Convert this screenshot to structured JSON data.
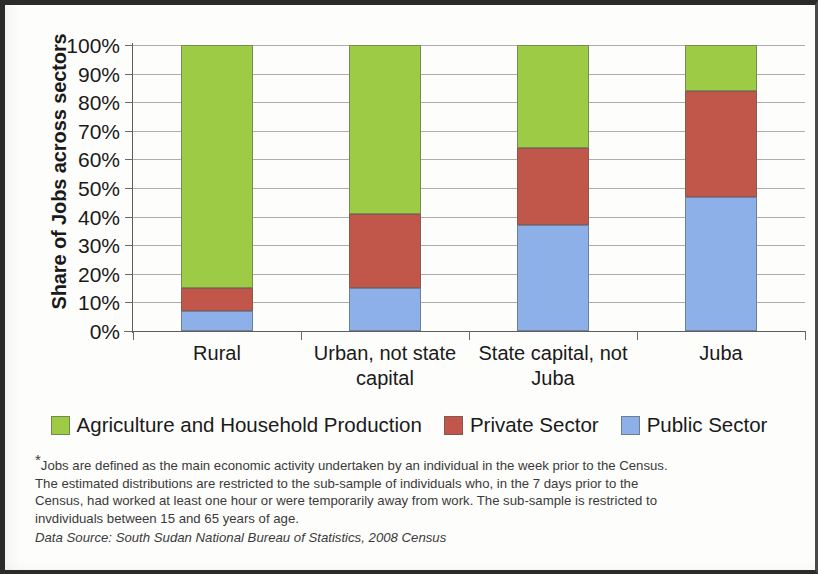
{
  "chart_data": {
    "type": "bar",
    "subtype": "stacked-100-percent",
    "title": "",
    "xlabel": "",
    "ylabel": "Share of Jobs across sectors",
    "ylim": [
      0,
      100
    ],
    "y_tick_labels": [
      "100%",
      "90%",
      "80%",
      "70%",
      "60%",
      "50%",
      "40%",
      "30%",
      "20%",
      "10%",
      "0%"
    ],
    "y_tick_values": [
      100,
      90,
      80,
      70,
      60,
      50,
      40,
      30,
      20,
      10,
      0
    ],
    "grid": true,
    "legend_position": "bottom",
    "categories": [
      "Rural",
      "Urban, not state capital",
      "State capital, not Juba",
      "Juba"
    ],
    "series": [
      {
        "name": "Agriculture and Household Production",
        "color": "#9ECB45",
        "values": [
          85,
          59,
          36,
          16
        ]
      },
      {
        "name": "Private Sector",
        "color": "#C1574A",
        "values": [
          8,
          26,
          27,
          37
        ]
      },
      {
        "name": "Public Sector",
        "color": "#8EB0E8",
        "values": [
          7,
          15,
          37,
          47
        ]
      }
    ],
    "stack_tops": {
      "public_sector": [
        7,
        15,
        37,
        47
      ],
      "private_sector_cumulative": [
        15,
        41,
        64,
        84
      ],
      "agriculture_cumulative": [
        100,
        100,
        100,
        100
      ]
    }
  },
  "axis": {
    "y_title": "Share of Jobs across sectors"
  },
  "legend": {
    "items": [
      {
        "label": "Agriculture and Household Production",
        "color": "#9ECB45"
      },
      {
        "label": "Private Sector",
        "color": "#C1574A"
      },
      {
        "label": "Public Sector",
        "color": "#8EB0E8"
      }
    ]
  },
  "footnote": {
    "star": "*",
    "lines": [
      "Jobs are defined as the main economic activity undertaken by an individual in the week prior to the Census.",
      "The estimated distributions are restricted to the sub-sample of individuals who, in the 7 days prior to the",
      "Census, had worked at least one hour or were temporarily away from work.  The sub-sample is restricted to",
      "invdividuals between 15 and 65 years of age."
    ],
    "source": "Data Source: South Sudan National Bureau of Statistics, 2008 Census"
  }
}
